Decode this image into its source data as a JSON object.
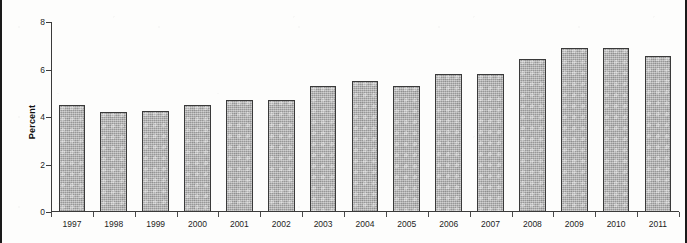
{
  "chart_data": {
    "type": "bar",
    "title": "",
    "xlabel": "",
    "ylabel": "Percent",
    "ylim": [
      0,
      8
    ],
    "ytick_labels": [
      "0",
      "2",
      "4",
      "6",
      "8"
    ],
    "yticks": [
      0,
      2,
      4,
      6,
      8
    ],
    "grid": false,
    "legend": null,
    "categories": [
      "1997",
      "1998",
      "1999",
      "2000",
      "2001",
      "2002",
      "2003",
      "2004",
      "2005",
      "2006",
      "2007",
      "2008",
      "2009",
      "2010",
      "2011"
    ],
    "values": [
      4.5,
      4.2,
      4.25,
      4.5,
      4.7,
      4.7,
      5.3,
      5.5,
      5.3,
      5.8,
      5.8,
      6.45,
      6.9,
      6.9,
      6.55
    ],
    "bar_color": "#a8a8a8",
    "bar_edge_color": "#3a3a3a",
    "axis_color": "#3b3b3b",
    "background_color": "#fdfdfc"
  },
  "axis": {
    "y_label": "Percent"
  }
}
